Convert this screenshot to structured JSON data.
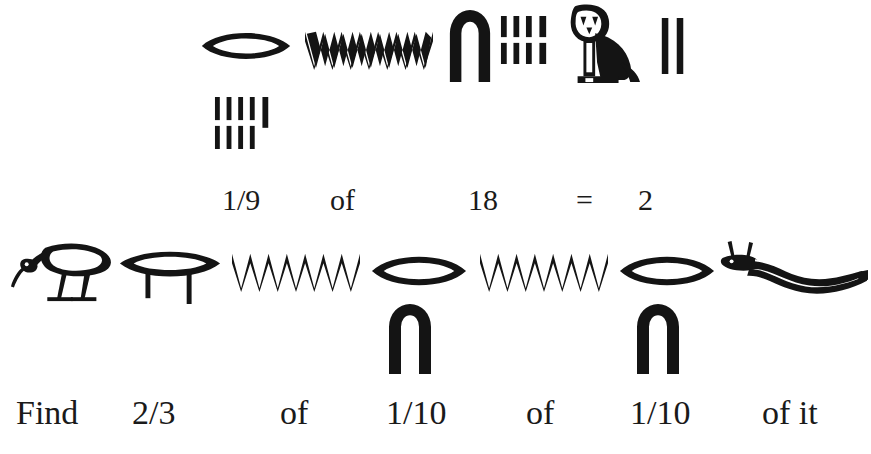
{
  "figure": {
    "background_color": "#ffffff",
    "ink_color": "#141414",
    "width": 871,
    "height": 454
  },
  "line1": {
    "name": "hieroglyph-line-1",
    "reading": "1/9 of 18 = 2",
    "glyphs": [
      {
        "id": "g1-mouth",
        "icon": "mouth-r-icon",
        "gardiner": "D21",
        "value": "r (fraction marker)",
        "x": 200,
        "y": 27,
        "w": 92,
        "h": 38
      },
      {
        "id": "g1-water-1",
        "icon": "water-ripple-n-icon",
        "gardiner": "N35",
        "value": "n",
        "x": 305,
        "y": 28,
        "w": 128,
        "h": 42
      },
      {
        "id": "g1-arch",
        "icon": "arch-ten-icon",
        "gardiner": "V20",
        "value": "10",
        "x": 447,
        "y": 8,
        "w": 46,
        "h": 74
      },
      {
        "id": "g1-strokes-8",
        "icon": "stroke-group-icon",
        "gardiner": "Z1",
        "value": "8",
        "count": 8,
        "rows": [
          4,
          4
        ],
        "x": 500,
        "y": 16,
        "w": 50,
        "h": 48
      },
      {
        "id": "g1-owl",
        "icon": "owl-m-icon",
        "gardiner": "G17",
        "value": "m (of)",
        "x": 562,
        "y": 4,
        "w": 78,
        "h": 80
      },
      {
        "id": "g1-strokes-2",
        "icon": "stroke-group-icon",
        "gardiner": "Z1",
        "value": "2",
        "count": 2,
        "rows": [
          2
        ],
        "x": 659,
        "y": 18,
        "w": 28,
        "h": 56
      },
      {
        "id": "g1-strokes-9",
        "icon": "stroke-group-icon",
        "gardiner": "Z1",
        "value": "9",
        "count": 9,
        "rows": [
          5,
          4
        ],
        "x": 214,
        "y": 97,
        "w": 62,
        "h": 52
      }
    ]
  },
  "gloss1": {
    "name": "gloss-line-1",
    "tokens": [
      {
        "text": "1/9",
        "x": 222,
        "y": 185
      },
      {
        "text": "of",
        "x": 330,
        "y": 185
      },
      {
        "text": "18",
        "x": 468,
        "y": 185
      },
      {
        "text": "=",
        "x": 576,
        "y": 185
      },
      {
        "text": "2",
        "x": 638,
        "y": 185
      }
    ]
  },
  "line2": {
    "name": "hieroglyph-line-2",
    "reading": "Find 2/3 of 1/10 of 1/10 of it",
    "glyphs": [
      {
        "id": "g2-ibis",
        "icon": "ibis-gm-icon",
        "gardiner": "G28",
        "value": "gm (find)",
        "x": 10,
        "y": 238,
        "w": 106,
        "h": 66
      },
      {
        "id": "g2-two-thirds",
        "icon": "two-thirds-fraction-icon",
        "gardiner": "D22",
        "value": "2/3",
        "x": 118,
        "y": 246,
        "w": 104,
        "h": 58
      },
      {
        "id": "g2-water-2",
        "icon": "water-ripple-n-icon",
        "gardiner": "N35",
        "value": "n",
        "x": 232,
        "y": 250,
        "w": 128,
        "h": 42
      },
      {
        "id": "g2-mouth-2",
        "icon": "mouth-r-icon",
        "gardiner": "D21",
        "value": "r (fraction marker)",
        "x": 370,
        "y": 250,
        "w": 98,
        "h": 42
      },
      {
        "id": "g2-arch-2",
        "icon": "arch-ten-icon",
        "gardiner": "V20",
        "value": "10",
        "x": 386,
        "y": 302,
        "w": 48,
        "h": 72
      },
      {
        "id": "g2-water-3",
        "icon": "water-ripple-n-icon",
        "gardiner": "N35",
        "value": "n",
        "x": 480,
        "y": 250,
        "w": 128,
        "h": 42
      },
      {
        "id": "g2-mouth-3",
        "icon": "mouth-r-icon",
        "gardiner": "D21",
        "value": "r (fraction marker)",
        "x": 618,
        "y": 250,
        "w": 98,
        "h": 42
      },
      {
        "id": "g2-arch-3",
        "icon": "arch-ten-icon",
        "gardiner": "V20",
        "value": "10",
        "x": 634,
        "y": 302,
        "w": 48,
        "h": 72
      },
      {
        "id": "g2-viper",
        "icon": "horned-viper-f-icon",
        "gardiner": "I9",
        "value": "f (it)",
        "x": 716,
        "y": 240,
        "w": 152,
        "h": 62
      }
    ]
  },
  "gloss2": {
    "name": "gloss-line-2",
    "tokens": [
      {
        "text": "Find",
        "x": 16,
        "y": 396
      },
      {
        "text": "2/3",
        "x": 132,
        "y": 396
      },
      {
        "text": "of",
        "x": 280,
        "y": 396
      },
      {
        "text": "1/10",
        "x": 386,
        "y": 396
      },
      {
        "text": "of",
        "x": 526,
        "y": 396
      },
      {
        "text": "1/10",
        "x": 630,
        "y": 396
      },
      {
        "text": "of it",
        "x": 762,
        "y": 396
      }
    ]
  }
}
